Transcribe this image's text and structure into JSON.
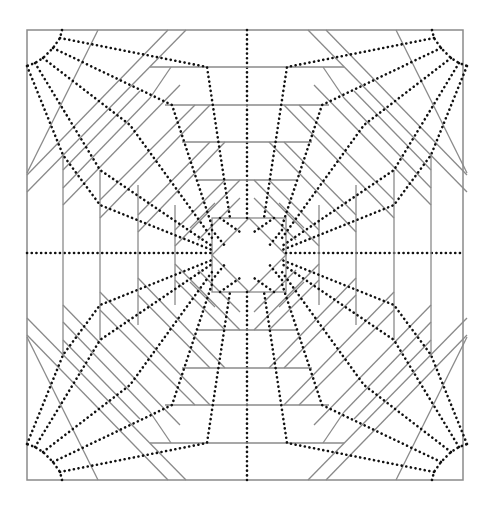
{
  "figure": {
    "title": "Origami crease pattern",
    "colors": {
      "background": "#ffffff",
      "mountain_fold": "#8a8a8a",
      "valley_fold": "#111111"
    },
    "legend": {
      "solid": "mountain fold (solid gray)",
      "dotted": "valley fold (dotted black)"
    },
    "paper": {
      "x": 27,
      "y": 30,
      "width": 436,
      "height": 450
    },
    "center": {
      "x": 245,
      "y": 255
    }
  }
}
